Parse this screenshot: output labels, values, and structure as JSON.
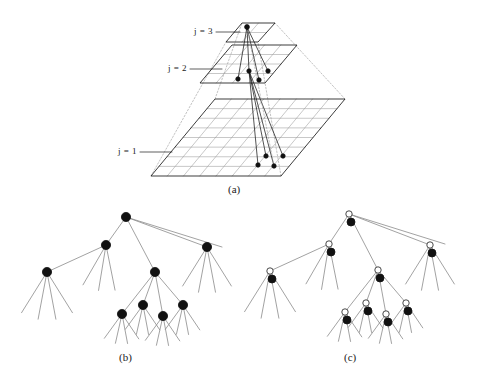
{
  "figure": {
    "title": "",
    "background": "#ffffff",
    "ink": "#1a1a1a",
    "grid_color": "#9a9a9a",
    "dash_color": "#9a9a9a",
    "node_fill": "#111111",
    "open_node_fill": "#ffffff",
    "width": 486,
    "height": 384
  },
  "panels": [
    {
      "id": "a",
      "caption": "(a)",
      "caption_x": 228,
      "caption_y": 183
    },
    {
      "id": "b",
      "caption": "(b)",
      "caption_x": 119,
      "caption_y": 351
    },
    {
      "id": "c",
      "caption": "(c)",
      "caption_x": 344,
      "caption_y": 351
    }
  ],
  "pyramid": {
    "description": "three-level multiresolution image pyramid with parent-child links",
    "levels": [
      {
        "label": "j = 1",
        "label_x": 118,
        "label_y": 152,
        "grid_cells": 8,
        "quad": [
          [
            151,
            176
          ],
          [
            281,
            176
          ],
          [
            345,
            99
          ],
          [
            215,
            99
          ]
        ]
      },
      {
        "label": "j = 2",
        "label_x": 168,
        "label_y": 69,
        "grid_cells": 4,
        "quad": [
          [
            200,
            83
          ],
          [
            265,
            83
          ],
          [
            297,
            45
          ],
          [
            232,
            45
          ]
        ]
      },
      {
        "label": "j = 3",
        "label_x": 194,
        "label_y": 32,
        "grid_cells": 2,
        "quad": [
          [
            226,
            42
          ],
          [
            258,
            42
          ],
          [
            275,
            23
          ],
          [
            242,
            23
          ]
        ]
      }
    ],
    "parent_node": {
      "x": 247,
      "y": 27,
      "level": 3
    },
    "level2_children": [
      {
        "x": 238,
        "y": 79
      },
      {
        "x": 249,
        "y": 71
      },
      {
        "x": 259,
        "y": 80
      },
      {
        "x": 268,
        "y": 71
      }
    ],
    "level1_children": [
      {
        "x": 258,
        "y": 165
      },
      {
        "x": 266,
        "y": 156
      },
      {
        "x": 274,
        "y": 166
      },
      {
        "x": 283,
        "y": 156
      }
    ],
    "apex_lines": "dotted pyramid frustum edges"
  },
  "tree_b": {
    "caption": "(b)",
    "node_style": "filled-disc",
    "node_radius": 4.6,
    "nodes": [
      {
        "id": "r",
        "x": 126,
        "y": 217,
        "level": 0
      },
      {
        "id": "n1",
        "x": 106,
        "y": 245,
        "level": 1
      },
      {
        "id": "n2",
        "x": 155,
        "y": 272,
        "level": 1
      },
      {
        "id": "n3",
        "x": 207,
        "y": 247,
        "level": 1
      },
      {
        "id": "n4",
        "x": 47,
        "y": 272,
        "level": 2
      },
      {
        "id": "n5",
        "x": 122,
        "y": 314,
        "level": 2
      },
      {
        "id": "n6",
        "x": 143,
        "y": 305,
        "level": 2
      },
      {
        "id": "n7",
        "x": 163,
        "y": 316,
        "level": 2
      },
      {
        "id": "n8",
        "x": 183,
        "y": 305,
        "level": 2
      }
    ],
    "edges": [
      [
        "r",
        "n1"
      ],
      [
        "r",
        "n2"
      ],
      [
        "r",
        "n3"
      ],
      [
        "r",
        "leaf_r4"
      ],
      [
        "n1",
        "n4"
      ],
      [
        "n1",
        "leaf_a1"
      ],
      [
        "n1",
        "leaf_a2"
      ],
      [
        "n1",
        "leaf_a3"
      ],
      [
        "n2",
        "n5"
      ],
      [
        "n2",
        "n6"
      ],
      [
        "n2",
        "n7"
      ],
      [
        "n2",
        "n8"
      ],
      [
        "n3",
        "leaf_c1"
      ],
      [
        "n3",
        "leaf_c2"
      ],
      [
        "n3",
        "leaf_c3"
      ],
      [
        "n3",
        "leaf_c4"
      ],
      [
        "n4",
        "leaf_d1"
      ],
      [
        "n4",
        "leaf_d2"
      ],
      [
        "n4",
        "leaf_d3"
      ],
      [
        "n4",
        "leaf_d4"
      ]
    ],
    "leaf_fan_count": 4
  },
  "tree_c": {
    "caption": "(c)",
    "node_style": "filled-disc-with-open-circle-above",
    "node_radius": 4.0,
    "open_radius": 3.2,
    "open_offset": {
      "dx": -2,
      "dy": -8
    },
    "nodes": [
      {
        "id": "r",
        "x": 351,
        "y": 222,
        "level": 0
      },
      {
        "id": "n1",
        "x": 331,
        "y": 252,
        "level": 1
      },
      {
        "id": "n2",
        "x": 380,
        "y": 278,
        "level": 1
      },
      {
        "id": "n3",
        "x": 432,
        "y": 253,
        "level": 1
      },
      {
        "id": "n4",
        "x": 272,
        "y": 279,
        "level": 2
      },
      {
        "id": "n5",
        "x": 347,
        "y": 320,
        "level": 2
      },
      {
        "id": "n6",
        "x": 368,
        "y": 311,
        "level": 2
      },
      {
        "id": "n7",
        "x": 388,
        "y": 322,
        "level": 2
      },
      {
        "id": "n8",
        "x": 408,
        "y": 311,
        "level": 2
      }
    ],
    "note": "same topology as (b); each node carries an open marker indicating an extra attribute"
  }
}
